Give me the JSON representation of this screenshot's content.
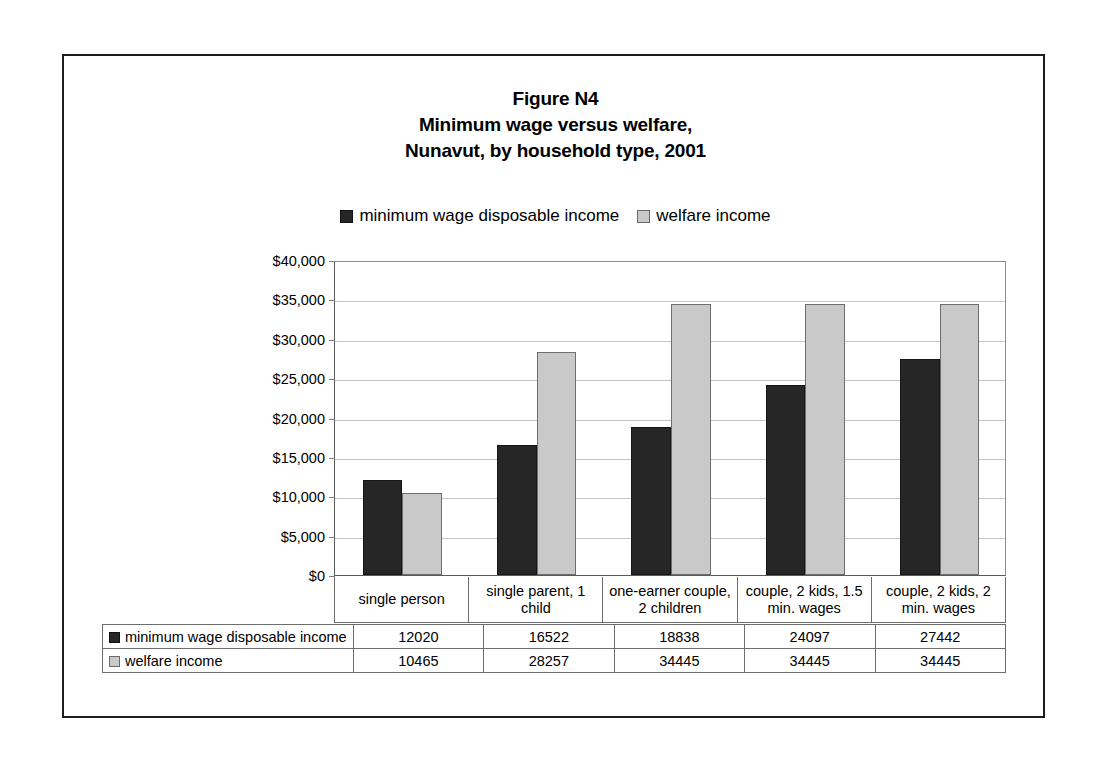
{
  "figure": {
    "title_lines": [
      "Figure N4",
      "Minimum wage versus welfare,",
      "Nunavut, by household type, 2001"
    ]
  },
  "chart_data": {
    "type": "bar",
    "title": "Figure N4 Minimum wage versus welfare, Nunavut, by household type, 2001",
    "xlabel": "",
    "ylabel": "",
    "ylim": [
      0,
      40000
    ],
    "ytick_labels": [
      "$0",
      "$5,000",
      "$10,000",
      "$15,000",
      "$20,000",
      "$25,000",
      "$30,000",
      "$35,000",
      "$40,000"
    ],
    "ytick_values": [
      0,
      5000,
      10000,
      15000,
      20000,
      25000,
      30000,
      35000,
      40000
    ],
    "grid": true,
    "legend_position": "top-center",
    "categories": [
      "single person",
      "single parent, 1 child",
      "one-earner couple, 2 children",
      "couple, 2 kids, 1.5 min. wages",
      "couple, 2 kids, 2 min. wages"
    ],
    "series": [
      {
        "name": "minimum wage disposable income",
        "color": "#262626",
        "values": [
          12020,
          16522,
          18838,
          24097,
          27442
        ]
      },
      {
        "name": "welfare income",
        "color": "#c9c9c9",
        "values": [
          10465,
          28257,
          34445,
          34445,
          34445
        ]
      }
    ]
  },
  "data_table": {
    "rows": [
      {
        "label": "minimum wage disposable income",
        "values": [
          "12020",
          "16522",
          "18838",
          "24097",
          "27442"
        ]
      },
      {
        "label": "welfare income",
        "values": [
          "10465",
          "28257",
          "34445",
          "34445",
          "34445"
        ]
      }
    ]
  }
}
